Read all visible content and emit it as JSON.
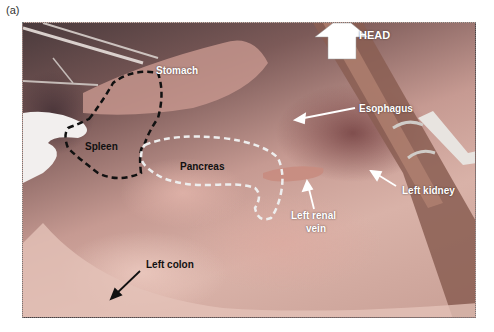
{
  "figure": {
    "panel_label": "(a)",
    "orientation_marker": {
      "icon": "up-arrow-icon",
      "label": "HEAD"
    },
    "annotations": [
      {
        "id": "stomach",
        "text": "Stomach",
        "color": "#ffffff"
      },
      {
        "id": "esophagus",
        "text": "Esophagus",
        "color": "#ffffff"
      },
      {
        "id": "spleen",
        "text": "Spleen",
        "color": "#111111",
        "outline": "black-dashed"
      },
      {
        "id": "pancreas",
        "text": "Pancreas",
        "color": "#111111",
        "outline": "white-dashed"
      },
      {
        "id": "left_renal_vein",
        "text_line1": "Left renal",
        "text_line2": "vein",
        "color": "#ffffff"
      },
      {
        "id": "left_kidney",
        "text": "Left kidney",
        "color": "#ffffff"
      },
      {
        "id": "left_colon",
        "text": "Left colon",
        "color": "#111111"
      }
    ]
  }
}
